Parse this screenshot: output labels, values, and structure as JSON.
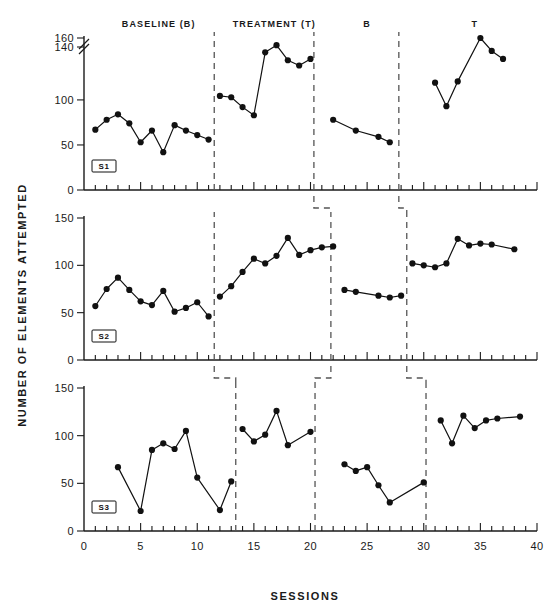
{
  "figure": {
    "y_axis_title": "NUMBER OF ELEMENTS ATTEMPTED",
    "x_axis_title": "SESSIONS",
    "phase_headers": [
      {
        "label": "BASELINE (B)",
        "x": 6.6
      },
      {
        "label": "TREATMENT (T)",
        "x": 16.8
      },
      {
        "label": "B",
        "x": 25.0
      },
      {
        "label": "T",
        "x": 34.5
      }
    ],
    "x_ticks": [
      0,
      5,
      10,
      15,
      20,
      25,
      30,
      35,
      40
    ]
  },
  "chart_data": {
    "type": "line",
    "title": "",
    "subtitle": "",
    "xlabel": "SESSIONS",
    "ylabel": "NUMBER OF ELEMENTS ATTEMPTED",
    "xlim": [
      0,
      40
    ],
    "grid": false,
    "legend": "none",
    "design": "multiple-baseline ABAB reversal across three subjects",
    "panels": [
      {
        "name": "S1",
        "subject_label": "S1",
        "ylim": [
          0,
          160
        ],
        "y_ticks": [
          0,
          50,
          100,
          140,
          160
        ],
        "y_axis_break": true,
        "y_axis_break_note": "axis broken between 100 and 140",
        "phase_change_sessions": [
          11.5,
          20.3,
          27.8
        ],
        "phases": [
          {
            "condition": "BASELINE (B)",
            "x": [
              1,
              2,
              3,
              4,
              5,
              6,
              7,
              8,
              9,
              10,
              11
            ],
            "y": [
              67,
              78,
              84,
              74,
              53,
              66,
              42,
              72,
              66,
              61,
              56
            ]
          },
          {
            "condition": "TREATMENT (T)",
            "x": [
              12,
              13,
              14,
              15,
              16,
              17,
              18,
              19,
              20
            ],
            "y": [
              103,
              102,
              92,
              83,
              136,
              144,
              130,
              126,
              131
            ]
          },
          {
            "condition": "B",
            "x": [
              22,
              24,
              26,
              27
            ],
            "y": [
              78,
              66,
              59,
              53
            ]
          },
          {
            "condition": "T",
            "x": [
              31,
              32,
              33,
              35,
              36,
              37
            ],
            "y": [
              113,
              93,
              114,
              160,
              137,
              131
            ]
          }
        ]
      },
      {
        "name": "S2",
        "subject_label": "S2",
        "ylim": [
          0,
          150
        ],
        "y_ticks": [
          0,
          50,
          100,
          150
        ],
        "y_axis_break": false,
        "phase_change_sessions": [
          11.5,
          21.8,
          28.5
        ],
        "phases": [
          {
            "condition": "BASELINE (B)",
            "x": [
              1,
              2,
              3,
              4,
              5,
              6,
              7,
              8,
              9,
              10,
              11
            ],
            "y": [
              57,
              75,
              87,
              74,
              62,
              58,
              73,
              51,
              55,
              61,
              46
            ]
          },
          {
            "condition": "TREATMENT (T)",
            "x": [
              12,
              13,
              14,
              15,
              16,
              17,
              18,
              19,
              20,
              21,
              22
            ],
            "y": [
              67,
              78,
              93,
              107,
              102,
              110,
              129,
              111,
              116,
              119,
              120
            ]
          },
          {
            "condition": "B",
            "x": [
              23,
              24,
              26,
              27,
              28
            ],
            "y": [
              74,
              72,
              68,
              66,
              68
            ]
          },
          {
            "condition": "T",
            "x": [
              29,
              30,
              31,
              32,
              33,
              34,
              35,
              36,
              38
            ],
            "y": [
              102,
              100,
              98,
              102,
              128,
              121,
              123,
              122,
              117
            ]
          }
        ]
      },
      {
        "name": "S3",
        "subject_label": "S3",
        "ylim": [
          0,
          150
        ],
        "y_ticks": [
          0,
          50,
          100,
          150
        ],
        "y_axis_break": false,
        "phase_change_sessions": [
          13.4,
          20.4,
          30.2
        ],
        "phases": [
          {
            "condition": "BASELINE (B)",
            "x": [
              3,
              5,
              6,
              7,
              8,
              9,
              10,
              12,
              13
            ],
            "y": [
              67,
              21,
              85,
              92,
              86,
              105,
              56,
              22,
              52
            ]
          },
          {
            "condition": "TREATMENT (T)",
            "x": [
              14,
              15,
              16,
              17,
              18,
              20
            ],
            "y": [
              107,
              94,
              101,
              126,
              90,
              104
            ]
          },
          {
            "condition": "B",
            "x": [
              23,
              24,
              25,
              26,
              27,
              30
            ],
            "y": [
              70,
              63,
              67,
              48,
              30,
              51
            ]
          },
          {
            "condition": "T",
            "x": [
              31.5,
              32.5,
              33.5,
              34.5,
              35.5,
              36.5,
              38.5
            ],
            "y": [
              116,
              92,
              121,
              108,
              116,
              118,
              120
            ]
          }
        ]
      }
    ],
    "interpanel_phase_steps": [
      {
        "from_panel": "S1",
        "to_panel": "S2",
        "x_top": 20.3,
        "x_bottom": 21.8
      },
      {
        "from_panel": "S1",
        "to_panel": "S2",
        "x_top": 27.8,
        "x_bottom": 28.5
      },
      {
        "from_panel": "S2",
        "to_panel": "S3",
        "x_top": 11.5,
        "x_bottom": 13.4
      },
      {
        "from_panel": "S2",
        "to_panel": "S3",
        "x_top": 21.8,
        "x_bottom": 20.4
      },
      {
        "from_panel": "S2",
        "to_panel": "S3",
        "x_top": 28.5,
        "x_bottom": 30.2
      }
    ]
  }
}
